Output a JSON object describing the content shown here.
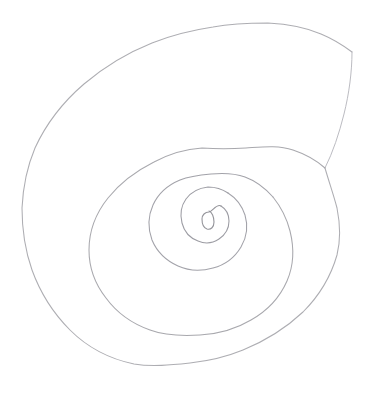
{
  "artwork": {
    "title": "Hand-drawn spiral",
    "medium": "pencil on paper",
    "subject": "spiral",
    "background_color": "#ffffff",
    "stroke_color": "#a9a9ae",
    "stroke_color_dark": "#8e8e95",
    "stroke_color_light": "#c2c2c8",
    "stroke_width": 1,
    "canvas": {
      "width": 368,
      "height": 399
    }
  },
  "geometry": {
    "center": {
      "x": 207,
      "y": 219
    },
    "turns": 3.5,
    "direction": "counterclockwise-outward",
    "core_loop": {
      "cx": 207,
      "cy": 219,
      "rx": 5,
      "ry": 7
    },
    "outer_end": {
      "x": 352,
      "y": 52
    },
    "aperture_join": {
      "x": 325,
      "y": 168
    },
    "horizontal_crossings_y218": [
      23,
      89,
      152,
      189,
      212,
      245,
      290,
      337
    ],
    "vertical_crossings_x201": [
      24,
      148,
      193,
      235,
      268,
      313,
      363
    ],
    "bounds": {
      "left": 22,
      "top": 23,
      "right": 353,
      "bottom": 365
    }
  },
  "layers": {
    "core": "spiral-core-loop",
    "whorl_1": "spiral-whorl-inner",
    "whorl_2": "spiral-whorl-middle",
    "whorl_3": "spiral-whorl-outer",
    "aperture": "spiral-aperture-edge"
  }
}
